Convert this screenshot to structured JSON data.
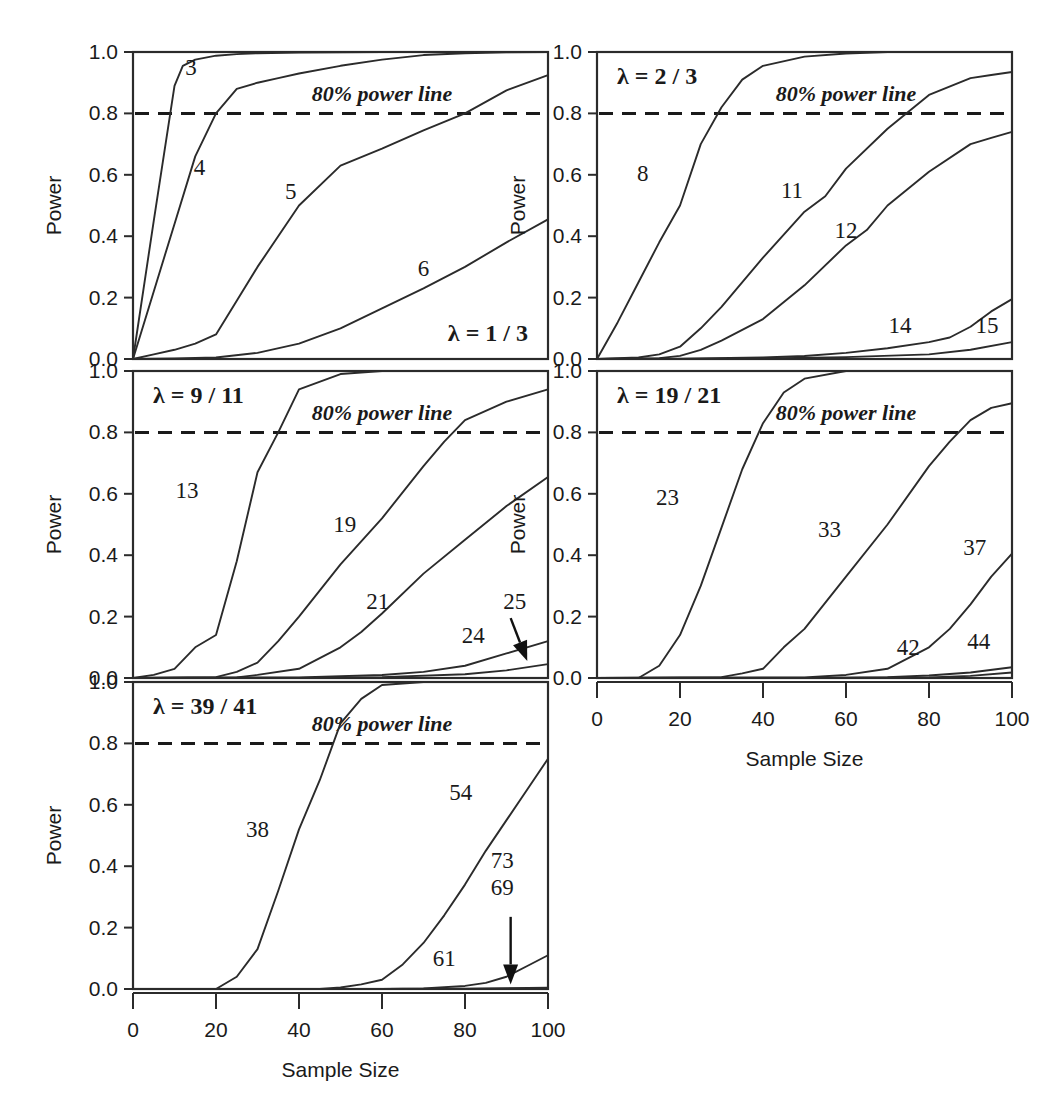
{
  "figure": {
    "background_color": "#ffffff",
    "ink_color": "#1a1a1a",
    "axis_titles": {
      "x": "Sample Size",
      "y": "Power"
    },
    "power_line_note": "80% power line",
    "lambda_symbol": "λ"
  },
  "axes": {
    "x_ticks": [
      "0",
      "20",
      "40",
      "60",
      "80",
      "100"
    ],
    "x_tick_values": [
      0,
      20,
      40,
      60,
      80,
      100
    ],
    "y_ticks": [
      "0.0",
      "0.2",
      "0.4",
      "0.6",
      "0.8",
      "1.0"
    ],
    "y_tick_values": [
      0.0,
      0.2,
      0.4,
      0.6,
      0.8,
      1.0
    ],
    "xlim": [
      0,
      100
    ],
    "ylim": [
      0.0,
      1.0
    ],
    "grid": false,
    "reference_line_y": 0.8
  },
  "chart_data": {
    "type": "line",
    "title": "",
    "subtitle": "",
    "xlabel": "Sample Size",
    "ylabel": "Power",
    "xlim": [
      0,
      100
    ],
    "ylim": [
      0.0,
      1.0
    ],
    "grid": false,
    "legend_position": "inline-curve-labels",
    "annotations": [
      {
        "text": "80% power line",
        "style": "bold-italic-serif",
        "in_every_panel": true
      },
      {
        "text": "dashed horizontal reference line at Power = 0.8",
        "style": "dashed"
      }
    ],
    "panels": [
      {
        "id": "panel-lambda-1-3",
        "lambda_label": "λ = 1 / 3",
        "lambda_value": "1/3",
        "lambda_position": "bottom-right",
        "note": "80% power line",
        "row": 0,
        "col": 0,
        "series": [
          {
            "name": "3",
            "label": "3",
            "label_at": {
              "x": 14,
              "y": 0.925
            },
            "x": [
              0,
              5,
              10,
              12,
              15,
              20,
              25,
              30,
              40,
              50,
              60,
              70,
              80,
              90,
              100
            ],
            "values": [
              0.0,
              0.45,
              0.89,
              0.955,
              0.975,
              0.988,
              0.993,
              0.996,
              0.998,
              0.999,
              1.0,
              1.0,
              1.0,
              1.0,
              1.0
            ]
          },
          {
            "name": "4",
            "label": "4",
            "label_at": {
              "x": 16,
              "y": 0.6
            },
            "x": [
              0,
              5,
              10,
              15,
              20,
              25,
              30,
              35,
              40,
              50,
              60,
              70,
              80,
              90,
              100
            ],
            "values": [
              0.0,
              0.22,
              0.44,
              0.66,
              0.8,
              0.88,
              0.9,
              0.915,
              0.93,
              0.955,
              0.975,
              0.99,
              0.996,
              0.999,
              1.0
            ]
          },
          {
            "name": "5",
            "label": "5",
            "label_at": {
              "x": 38,
              "y": 0.52
            },
            "x": [
              0,
              5,
              10,
              15,
              20,
              25,
              30,
              40,
              50,
              60,
              70,
              80,
              90,
              100
            ],
            "values": [
              0.0,
              0.015,
              0.03,
              0.05,
              0.08,
              0.19,
              0.3,
              0.5,
              0.63,
              0.685,
              0.745,
              0.8,
              0.875,
              0.925
            ]
          },
          {
            "name": "6",
            "label": "6",
            "label_at": {
              "x": 70,
              "y": 0.27
            },
            "x": [
              0,
              10,
              20,
              30,
              40,
              50,
              60,
              70,
              80,
              90,
              100
            ],
            "values": [
              0.0,
              0.002,
              0.005,
              0.02,
              0.05,
              0.1,
              0.165,
              0.23,
              0.3,
              0.38,
              0.455
            ]
          }
        ]
      },
      {
        "id": "panel-lambda-2-3",
        "lambda_label": "λ = 2 / 3",
        "lambda_value": "2/3",
        "lambda_position": "top-left",
        "note": "80% power line",
        "row": 0,
        "col": 1,
        "series": [
          {
            "name": "8",
            "label": "8",
            "label_at": {
              "x": 11,
              "y": 0.58
            },
            "x": [
              0,
              5,
              10,
              15,
              20,
              25,
              30,
              35,
              40,
              50,
              60,
              70,
              80,
              90,
              100
            ],
            "values": [
              0.0,
              0.12,
              0.25,
              0.38,
              0.5,
              0.7,
              0.82,
              0.91,
              0.955,
              0.985,
              0.995,
              1.0,
              1.0,
              1.0,
              1.0
            ]
          },
          {
            "name": "11",
            "label": "11",
            "label_at": {
              "x": 47,
              "y": 0.525
            },
            "x": [
              0,
              10,
              15,
              20,
              25,
              30,
              40,
              50,
              55,
              60,
              70,
              80,
              90,
              95,
              100
            ],
            "values": [
              0.0,
              0.005,
              0.015,
              0.04,
              0.1,
              0.17,
              0.33,
              0.48,
              0.53,
              0.62,
              0.75,
              0.86,
              0.915,
              0.925,
              0.935
            ]
          },
          {
            "name": "12",
            "label": "12",
            "label_at": {
              "x": 60,
              "y": 0.395
            },
            "x": [
              0,
              15,
              20,
              25,
              30,
              40,
              50,
              60,
              65,
              70,
              80,
              90,
              95,
              100
            ],
            "values": [
              0.0,
              0.003,
              0.01,
              0.03,
              0.06,
              0.13,
              0.24,
              0.37,
              0.42,
              0.5,
              0.61,
              0.7,
              0.72,
              0.74
            ]
          },
          {
            "name": "14",
            "label": "14",
            "label_at": {
              "x": 73,
              "y": 0.085
            },
            "x": [
              0,
              20,
              40,
              50,
              60,
              70,
              80,
              85,
              90,
              95,
              100
            ],
            "values": [
              0.0,
              0.001,
              0.005,
              0.01,
              0.02,
              0.035,
              0.055,
              0.07,
              0.105,
              0.155,
              0.195
            ]
          },
          {
            "name": "15",
            "label": "15",
            "label_at": {
              "x": 94,
              "y": 0.085
            },
            "x": [
              0,
              20,
              40,
              60,
              80,
              90,
              100
            ],
            "values": [
              0.0,
              0.0,
              0.002,
              0.006,
              0.015,
              0.03,
              0.055
            ]
          }
        ]
      },
      {
        "id": "panel-lambda-9-11",
        "lambda_label": "λ = 9 / 11",
        "lambda_value": "9/11",
        "lambda_position": "top-left",
        "note": "80% power line",
        "row": 1,
        "col": 0,
        "series": [
          {
            "name": "13",
            "label": "13",
            "label_at": {
              "x": 13,
              "y": 0.585
            },
            "x": [
              0,
              5,
              10,
              15,
              20,
              25,
              30,
              35,
              40,
              50,
              60,
              70,
              80,
              90,
              100
            ],
            "values": [
              0.0,
              0.01,
              0.03,
              0.1,
              0.14,
              0.38,
              0.67,
              0.8,
              0.94,
              0.99,
              1.0,
              1.0,
              1.0,
              1.0,
              1.0
            ]
          },
          {
            "name": "19",
            "label": "19",
            "label_at": {
              "x": 51,
              "y": 0.475
            },
            "x": [
              0,
              20,
              25,
              30,
              35,
              40,
              50,
              60,
              70,
              75,
              80,
              90,
              100
            ],
            "values": [
              0.0,
              0.003,
              0.02,
              0.05,
              0.12,
              0.2,
              0.37,
              0.52,
              0.69,
              0.77,
              0.84,
              0.9,
              0.94
            ]
          },
          {
            "name": "21",
            "label": "21",
            "label_at": {
              "x": 59,
              "y": 0.225
            },
            "x": [
              0,
              25,
              30,
              40,
              50,
              55,
              60,
              70,
              80,
              90,
              100
            ],
            "values": [
              0.0,
              0.002,
              0.01,
              0.03,
              0.1,
              0.15,
              0.21,
              0.34,
              0.45,
              0.56,
              0.655
            ]
          },
          {
            "name": "24",
            "label": "24",
            "label_at": {
              "x": 82,
              "y": 0.115
            },
            "x": [
              0,
              40,
              60,
              70,
              80,
              90,
              100
            ],
            "values": [
              0.0,
              0.002,
              0.01,
              0.02,
              0.04,
              0.08,
              0.12
            ]
          },
          {
            "name": "25",
            "label": "25",
            "label_at": {
              "x": 92,
              "y": 0.225
            },
            "arrow": {
              "from": {
                "x": 91,
                "y": 0.195
              },
              "to": {
                "x": 95,
                "y": 0.055
              }
            },
            "x": [
              0,
              40,
              60,
              80,
              90,
              100
            ],
            "values": [
              0.0,
              0.0,
              0.003,
              0.012,
              0.025,
              0.045
            ]
          }
        ]
      },
      {
        "id": "panel-lambda-19-21",
        "lambda_label": "λ = 19 / 21",
        "lambda_value": "19/21",
        "lambda_position": "top-left",
        "note": "80% power line",
        "row": 1,
        "col": 1,
        "series": [
          {
            "name": "23",
            "label": "23",
            "label_at": {
              "x": 17,
              "y": 0.565
            },
            "x": [
              0,
              10,
              15,
              20,
              25,
              30,
              35,
              40,
              45,
              50,
              60,
              70,
              80,
              90,
              100
            ],
            "values": [
              0.0,
              0.0,
              0.04,
              0.14,
              0.3,
              0.49,
              0.68,
              0.83,
              0.93,
              0.975,
              1.0,
              1.0,
              1.0,
              1.0,
              1.0
            ]
          },
          {
            "name": "33",
            "label": "33",
            "label_at": {
              "x": 56,
              "y": 0.46
            },
            "x": [
              0,
              30,
              35,
              40,
              45,
              50,
              60,
              70,
              80,
              85,
              90,
              95,
              100
            ],
            "values": [
              0.0,
              0.003,
              0.015,
              0.03,
              0.1,
              0.16,
              0.33,
              0.5,
              0.69,
              0.77,
              0.84,
              0.88,
              0.895
            ]
          },
          {
            "name": "37",
            "label": "37",
            "label_at": {
              "x": 91,
              "y": 0.4
            },
            "x": [
              0,
              50,
              60,
              70,
              80,
              85,
              90,
              95,
              100
            ],
            "values": [
              0.0,
              0.002,
              0.01,
              0.03,
              0.1,
              0.16,
              0.24,
              0.33,
              0.405
            ]
          },
          {
            "name": "42",
            "label": "42",
            "label_at": {
              "x": 75,
              "y": 0.075
            },
            "x": [
              0,
              50,
              70,
              80,
              90,
              100
            ],
            "values": [
              0.0,
              0.0,
              0.003,
              0.008,
              0.018,
              0.035
            ]
          },
          {
            "name": "44",
            "label": "44",
            "label_at": {
              "x": 92,
              "y": 0.095
            },
            "x": [
              0,
              60,
              80,
              90,
              100
            ],
            "values": [
              0.0,
              0.0,
              0.002,
              0.007,
              0.018
            ]
          }
        ]
      },
      {
        "id": "panel-lambda-39-41",
        "lambda_label": "λ = 39 / 41",
        "lambda_value": "39/41",
        "lambda_position": "top-left",
        "note": "80% power line",
        "row": 2,
        "col": 0,
        "series": [
          {
            "name": "38",
            "label": "38",
            "label_at": {
              "x": 30,
              "y": 0.495
            },
            "x": [
              0,
              20,
              25,
              30,
              35,
              40,
              45,
              50,
              55,
              60,
              70,
              80,
              90,
              100
            ],
            "values": [
              0.0,
              0.0,
              0.04,
              0.13,
              0.32,
              0.52,
              0.68,
              0.865,
              0.945,
              0.99,
              1.0,
              1.0,
              1.0,
              1.0
            ]
          },
          {
            "name": "54",
            "label": "54",
            "label_at": {
              "x": 79,
              "y": 0.615
            },
            "x": [
              0,
              45,
              50,
              55,
              60,
              65,
              70,
              75,
              80,
              85,
              90,
              95,
              100
            ],
            "values": [
              0.0,
              0.0,
              0.005,
              0.015,
              0.03,
              0.08,
              0.15,
              0.24,
              0.34,
              0.45,
              0.55,
              0.65,
              0.75
            ]
          },
          {
            "name": "61",
            "label": "61",
            "label_at": {
              "x": 75,
              "y": 0.075
            },
            "x": [
              0,
              60,
              70,
              80,
              85,
              90,
              95,
              100
            ],
            "values": [
              0.0,
              0.0,
              0.002,
              0.01,
              0.02,
              0.04,
              0.075,
              0.11
            ]
          },
          {
            "name": "73",
            "label": "73",
            "label_at": {
              "x": 89,
              "y": 0.395
            },
            "arrow": {
              "from": {
                "x": 91,
                "y": 0.235
              },
              "to": {
                "x": 91,
                "y": 0.015
              }
            },
            "x": [
              0,
              60,
              80,
              100
            ],
            "values": [
              0.0,
              0.0,
              0.0,
              0.002
            ]
          },
          {
            "name": "69",
            "label": "69",
            "label_at": {
              "x": 89,
              "y": 0.305
            },
            "x": [
              0,
              60,
              80,
              100
            ],
            "values": [
              0.0,
              0.0,
              0.001,
              0.004
            ]
          }
        ]
      }
    ]
  }
}
